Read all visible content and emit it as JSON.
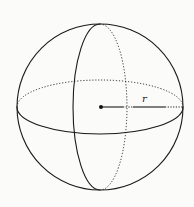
{
  "diagram": {
    "radius_label": "r",
    "colors": {
      "stroke": "#1a1a1a",
      "background": "#fbfbf9"
    },
    "sphere": {
      "cx": 100,
      "cy": 107,
      "r": 83
    },
    "equator": {
      "rx": 83,
      "ry": 27
    },
    "meridian": {
      "rx": 27,
      "ry": 83
    }
  }
}
